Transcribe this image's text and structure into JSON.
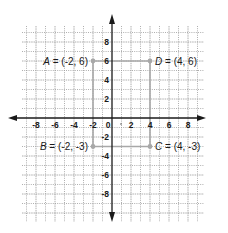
{
  "diagram": {
    "type": "coordinate-plane",
    "x_range": [
      -9,
      9
    ],
    "y_range": [
      -9,
      9
    ],
    "tick_step": 2,
    "x_tick_labels": [
      "-8",
      "-6",
      "-4",
      "-2",
      "0",
      "2",
      "4",
      "6",
      "8"
    ],
    "y_tick_labels": [
      "8",
      "6",
      "4",
      "2",
      "-2",
      "-4",
      "-6",
      "-8"
    ],
    "colors": {
      "axis": "#1a1a1a",
      "grid": "#9a9a9a",
      "shape": "#a8a8a8",
      "text": "#1a1a1a"
    },
    "points": [
      {
        "name": "A",
        "label": "A = (-2, 6)",
        "x": -2,
        "y": 6
      },
      {
        "name": "D",
        "label": "D = (4, 6)",
        "x": 4,
        "y": 6
      },
      {
        "name": "B",
        "label": "B = (-2, -3)",
        "x": -2,
        "y": -3
      },
      {
        "name": "C",
        "label": "C = (4, -3)",
        "x": 4,
        "y": -3
      }
    ]
  }
}
